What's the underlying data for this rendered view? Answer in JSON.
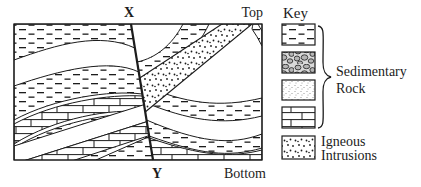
{
  "figure": {
    "section_labels": {
      "x": "X",
      "y": "Y",
      "top": "Top",
      "bottom": "Bottom"
    },
    "key": {
      "title": "Key",
      "sedimentary_label_lines": [
        "Sedimentary",
        "Rock"
      ],
      "igneous_label_lines": [
        "Igneous",
        "Intrusions"
      ],
      "swatches": [
        {
          "name": "shale-dashes"
        },
        {
          "name": "conglomerate-pebbles"
        },
        {
          "name": "sandstone-stipple"
        },
        {
          "name": "limestone-bricks"
        },
        {
          "name": "igneous-intrusion-dots"
        }
      ]
    },
    "colors": {
      "ink": "#1c1c1c",
      "paper": "#ffffff",
      "pebble_fill": "#b5b5b5",
      "pebble_bg": "#d9d9d9"
    }
  }
}
